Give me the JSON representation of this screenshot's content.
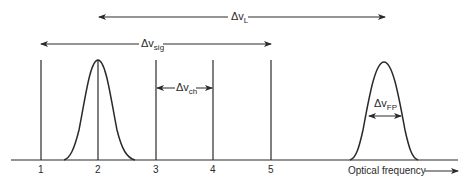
{
  "diagram": {
    "labels": {
      "delta_v_L": {
        "main": "Δv",
        "sub": "L"
      },
      "delta_v_sig": {
        "main": "Δv",
        "sub": "sig"
      },
      "delta_v_ch": {
        "main": "Δv",
        "sub": "ch"
      },
      "delta_v_FP": {
        "main": "Δv",
        "sub": "FP"
      }
    },
    "ticks": [
      "1",
      "2",
      "3",
      "4",
      "5"
    ],
    "axis_label": "Optical frequency",
    "colors": {
      "stroke": "#2a2a2a",
      "background": "#ffffff"
    }
  }
}
